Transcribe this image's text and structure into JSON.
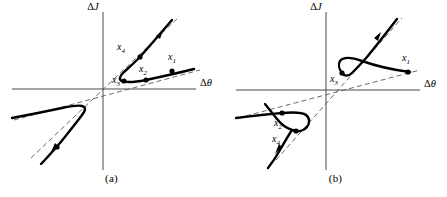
{
  "figure": {
    "type": "phase-space-diagram-pair",
    "background_color": "#ffffff",
    "ink_color": "#000000",
    "axis_color": "#4a4a4a",
    "asymptote_color": "#5a5a5a"
  },
  "axes": {
    "x_label": "Δθ",
    "y_label": "ΔJ",
    "x_label_delta": "Δ",
    "x_label_var": "θ",
    "y_label_delta": "Δ",
    "y_label_var": "J"
  },
  "panels": [
    {
      "id": "a",
      "caption": "(a)",
      "x_axis_label": "Δθ",
      "y_axis_label": "ΔJ",
      "origin": {
        "x": 103,
        "y": 89
      },
      "asymptotes": [
        {
          "name": "steep-asymptote",
          "slope_description": "steep-positive",
          "style": "dashed"
        },
        {
          "name": "shallow-asymptote",
          "slope_description": "shallow-positive",
          "style": "dashed"
        }
      ],
      "trajectories": [
        {
          "name": "upper-right-branch",
          "quadrant": "I",
          "shape": "hyperbolic-branch-opening-right"
        },
        {
          "name": "lower-left-branch",
          "quadrant": "III",
          "shape": "hyperbolic-branch-opening-left"
        }
      ],
      "points": [
        {
          "label": "x",
          "subscript": "1",
          "text": "x₁",
          "quadrant": "I",
          "position_description": "far-right-on-shallow-branch"
        },
        {
          "label": "x",
          "subscript": "2",
          "text": "x₂",
          "quadrant": "I",
          "position_description": "mid-right-on-shallow-branch"
        },
        {
          "label": "x",
          "subscript": "3",
          "text": "x₃",
          "quadrant": "I",
          "position_description": "at-turning-point-of-branch"
        },
        {
          "label": "x",
          "subscript": "4",
          "text": "x₄",
          "quadrant": "I",
          "position_description": "upper-left-on-steep-branch"
        }
      ],
      "arrows": [
        {
          "name": "flow-arrow-upper",
          "direction": "outward-up-right-along-steep-asymptote"
        },
        {
          "name": "flow-arrow-lower",
          "direction": "outward-down-left-along-steep-asymptote"
        }
      ]
    },
    {
      "id": "b",
      "caption": "(b)",
      "x_axis_label": "Δθ",
      "y_axis_label": "ΔJ",
      "origin": {
        "x": 102,
        "y": 90
      },
      "asymptotes": [
        {
          "name": "steep-asymptote",
          "slope_description": "steep-positive",
          "style": "dashed"
        },
        {
          "name": "shallow-asymptote",
          "slope_description": "shallow-positive",
          "style": "dashed"
        }
      ],
      "trajectories": [
        {
          "name": "upper-right-branch",
          "quadrant": "I",
          "shape": "hyperbolic-branch-opening-up"
        },
        {
          "name": "lower-left-branch",
          "quadrant": "III",
          "shape": "hyperbolic-branch-opening-down"
        }
      ],
      "points": [
        {
          "label": "x",
          "subscript": "1",
          "text": "x₁",
          "quadrant": "I",
          "position_description": "far-right-on-shallow-branch"
        },
        {
          "label": "x",
          "subscript": "3",
          "text": "x₃",
          "quadrant": "I",
          "position_description": "at-turning-point-of-branch"
        },
        {
          "label": "x",
          "subscript": "2",
          "text": "x₂",
          "quadrant": "III",
          "position_description": "far-left-on-shallow-branch"
        },
        {
          "label": "x",
          "subscript": "4",
          "text": "x₄",
          "quadrant": "III",
          "position_description": "at-turning-point-of-lower-branch"
        }
      ],
      "arrows": [
        {
          "name": "flow-arrow-upper",
          "direction": "outward-up-right-along-steep-asymptote"
        },
        {
          "name": "flow-arrow-lower",
          "direction": "outward-down-left-along-steep-asymptote"
        }
      ]
    }
  ],
  "labels": {
    "x1": "x",
    "x1_sub": "1",
    "x2": "x",
    "x2_sub": "2",
    "x3": "x",
    "x3_sub": "3",
    "x4": "x",
    "x4_sub": "4",
    "caption_a": "(a)",
    "caption_b": "(b)"
  }
}
